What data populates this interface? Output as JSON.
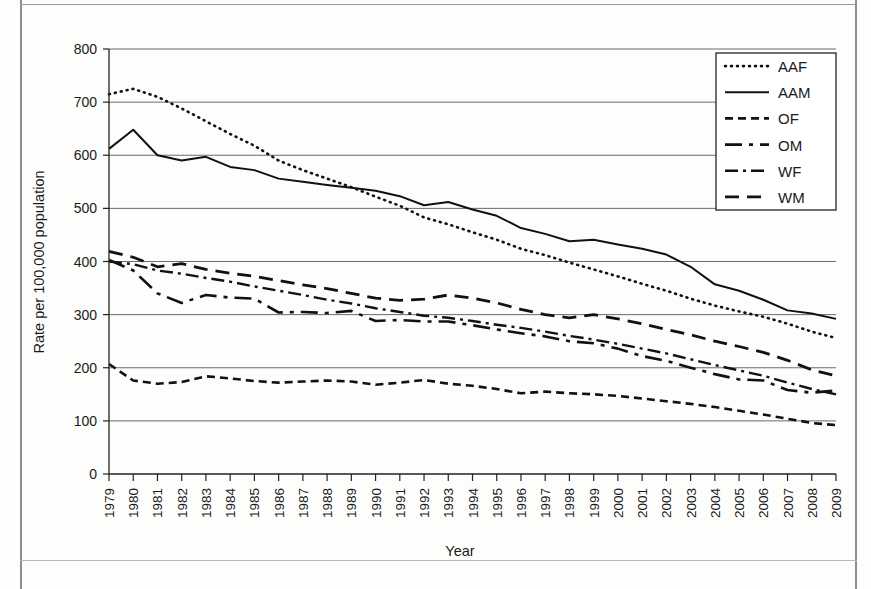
{
  "chart_data": {
    "type": "line",
    "title": "",
    "xlabel": "Year",
    "ylabel": "Rate per 100,000 population",
    "grid": true,
    "legend_position": "top-right",
    "ylim": [
      0,
      800
    ],
    "ytick_labels": [
      "0",
      "100",
      "200",
      "300",
      "400",
      "500",
      "600",
      "700",
      "800"
    ],
    "ytick_values": [
      0,
      100,
      200,
      300,
      400,
      500,
      600,
      700,
      800
    ],
    "categories": [
      "1979",
      "1980",
      "1981",
      "1982",
      "1983",
      "1984",
      "1985",
      "1986",
      "1987",
      "1988",
      "1989",
      "1990",
      "1991",
      "1992",
      "1993",
      "1994",
      "1995",
      "1996",
      "1997",
      "1998",
      "1999",
      "2000",
      "2001",
      "2002",
      "2003",
      "2004",
      "2005",
      "2006",
      "2007",
      "2008",
      "2009"
    ],
    "series": [
      {
        "name": "AAF",
        "dash": "1,5",
        "width": 2.6,
        "linecap": "round",
        "values": [
          715,
          725,
          710,
          688,
          664,
          640,
          618,
          590,
          572,
          556,
          540,
          522,
          505,
          483,
          470,
          455,
          441,
          424,
          412,
          398,
          385,
          372,
          358,
          345,
          330,
          317,
          306,
          296,
          283,
          268,
          256
        ]
      },
      {
        "name": "AAM",
        "dash": "",
        "width": 2.0,
        "linecap": "butt",
        "values": [
          612,
          648,
          600,
          590,
          597,
          578,
          572,
          556,
          550,
          544,
          539,
          533,
          523,
          506,
          512,
          498,
          486,
          463,
          452,
          438,
          441,
          432,
          424,
          413,
          390,
          357,
          345,
          328,
          308,
          302,
          292
        ]
      },
      {
        "name": "OF",
        "dash": "8,5",
        "width": 2.6,
        "linecap": "butt",
        "values": [
          207,
          176,
          170,
          173,
          184,
          180,
          175,
          172,
          174,
          176,
          174,
          168,
          172,
          177,
          170,
          166,
          160,
          152,
          155,
          152,
          150,
          147,
          142,
          137,
          132,
          126,
          119,
          112,
          104,
          96,
          92
        ]
      },
      {
        "name": "OM",
        "dash": "17,7,4,7",
        "width": 2.6,
        "linecap": "butt",
        "values": [
          403,
          383,
          340,
          322,
          337,
          332,
          330,
          304,
          305,
          303,
          307,
          288,
          290,
          287,
          287,
          280,
          272,
          265,
          259,
          250,
          246,
          236,
          222,
          213,
          200,
          188,
          178,
          176,
          158,
          153,
          157
        ]
      },
      {
        "name": "WF",
        "dash": "13,5,3,5",
        "width": 2.4,
        "linecap": "butt",
        "values": [
          400,
          395,
          383,
          377,
          369,
          362,
          353,
          345,
          337,
          328,
          321,
          312,
          305,
          298,
          294,
          288,
          281,
          275,
          268,
          260,
          253,
          245,
          236,
          227,
          216,
          205,
          195,
          185,
          172,
          160,
          150
        ]
      },
      {
        "name": "WM",
        "dash": "14,8",
        "width": 2.8,
        "linecap": "butt",
        "values": [
          419,
          408,
          390,
          396,
          385,
          378,
          372,
          364,
          356,
          349,
          340,
          331,
          327,
          329,
          337,
          331,
          322,
          310,
          300,
          294,
          300,
          292,
          283,
          272,
          262,
          250,
          240,
          229,
          214,
          196,
          185
        ]
      }
    ]
  },
  "legend": {
    "entries": [
      {
        "label": "AAF"
      },
      {
        "label": "AAM"
      },
      {
        "label": "OF"
      },
      {
        "label": "OM"
      },
      {
        "label": "WF"
      },
      {
        "label": "WM"
      }
    ]
  },
  "colors": {
    "ink": "#111111",
    "grid": "#5a5a5a",
    "page": "#fdfdfc",
    "border": "#8e8e8e"
  }
}
